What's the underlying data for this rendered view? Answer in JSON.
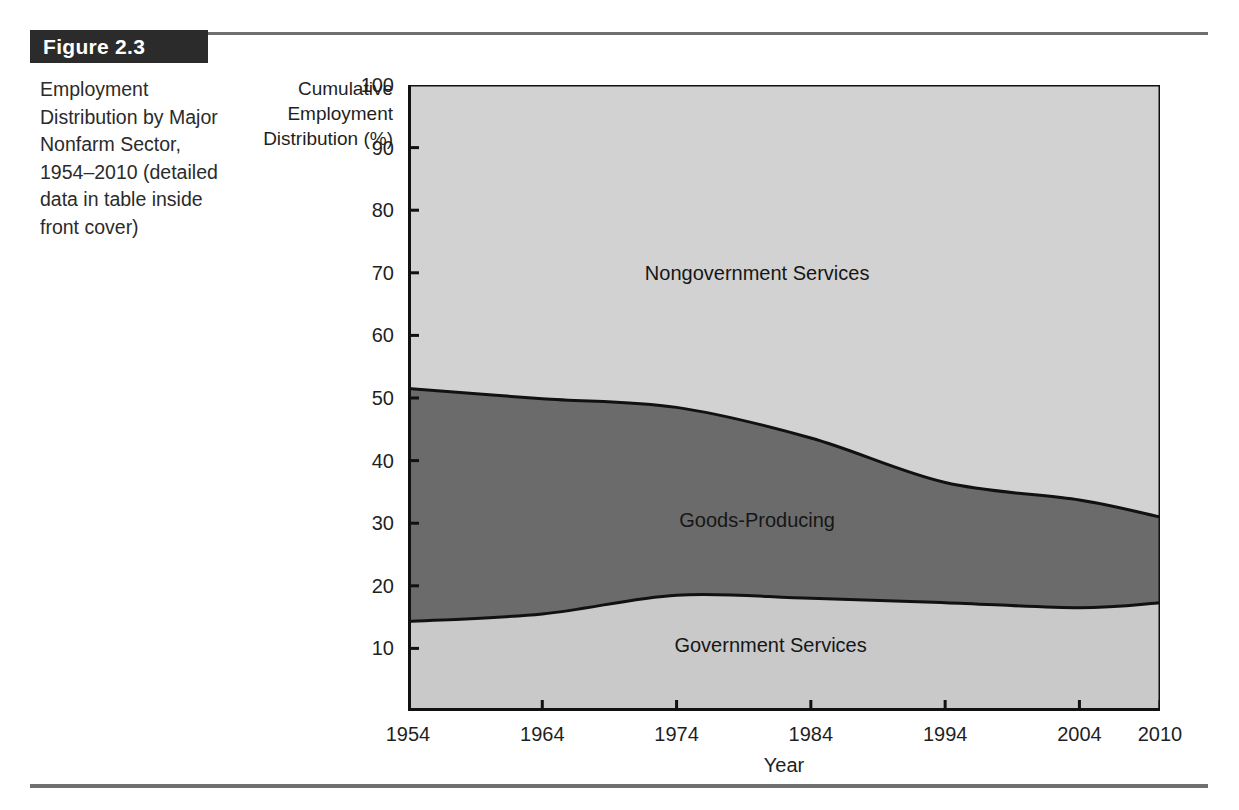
{
  "figure": {
    "tag_label": "Figure 2.3",
    "caption": "Employment Distribution by Major Nonfarm Sector, 1954–2010 (detailed data in table inside front cover)"
  },
  "colors": {
    "nongovernment_services": "#d2d2d2",
    "goods_producing": "#6b6b6b",
    "government_services": "#c9c9c9",
    "outline": "#111111",
    "rule": "#6f6f6f",
    "tag_background": "#2b2b2b",
    "tag_text": "#ffffff"
  },
  "chart_data": {
    "type": "area",
    "title": "Employment Distribution by Major Nonfarm Sector, 1954–2010",
    "xlabel": "Year",
    "ylabel": "Cumulative Employment Distribution (%)",
    "stacked": true,
    "grid": false,
    "legend_position": "in-plot",
    "xlim": [
      1954,
      2010
    ],
    "ylim": [
      0,
      100
    ],
    "x": [
      1954,
      1964,
      1974,
      1984,
      1994,
      2004,
      2010
    ],
    "xtick_labels": [
      "1954",
      "1964",
      "1974",
      "1984",
      "1994",
      "2004",
      "2010"
    ],
    "ytick_values": [
      10,
      20,
      30,
      40,
      50,
      60,
      70,
      80,
      90,
      100
    ],
    "ytick_labels": [
      "10",
      "20",
      "30",
      "40",
      "50",
      "60",
      "70",
      "80",
      "90",
      "100"
    ],
    "series": [
      {
        "name": "Government Services",
        "color": "#c9c9c9",
        "values": [
          14.3,
          15.5,
          18.5,
          18.0,
          17.3,
          16.5,
          17.3
        ],
        "cumulative_upper": [
          14.3,
          15.5,
          18.5,
          18.0,
          17.3,
          16.5,
          17.3
        ]
      },
      {
        "name": "Goods-Producing",
        "color": "#6b6b6b",
        "values": [
          37.2,
          34.4,
          30.0,
          25.6,
          19.2,
          17.2,
          13.7
        ],
        "cumulative_upper": [
          51.5,
          49.9,
          48.5,
          43.6,
          36.5,
          33.7,
          31.0
        ]
      },
      {
        "name": "Nongovernment Services",
        "color": "#d2d2d2",
        "values": [
          48.5,
          50.1,
          51.5,
          56.4,
          63.5,
          66.3,
          69.0
        ],
        "cumulative_upper": [
          100,
          100,
          100,
          100,
          100,
          100,
          100
        ]
      }
    ],
    "annotations": [
      {
        "text": "Nongovernment Services",
        "x": 1980,
        "y": 70
      },
      {
        "text": "Goods-Producing",
        "x": 1980,
        "y": 30.5
      },
      {
        "text": "Government Services",
        "x": 1981,
        "y": 10.5
      }
    ]
  }
}
